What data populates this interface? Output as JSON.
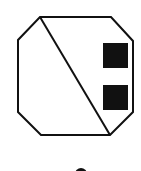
{
  "diagram": {
    "background": "#ffffff",
    "stroke_color": "#111111",
    "fill_color": "#111111",
    "octagon": {
      "points": "40,17 111,17 133,41 133,112 110,135 41,135 18,112 18,40"
    },
    "diagonal": {
      "x1": 40,
      "y1": 17,
      "x2": 110,
      "y2": 135
    },
    "squares": [
      {
        "x": 103,
        "y": 43,
        "width": 25,
        "height": 25
      },
      {
        "x": 103,
        "y": 85,
        "width": 25,
        "height": 25
      }
    ],
    "bottom_marker": {
      "cx": 81,
      "cy": 174,
      "r": 6
    }
  }
}
